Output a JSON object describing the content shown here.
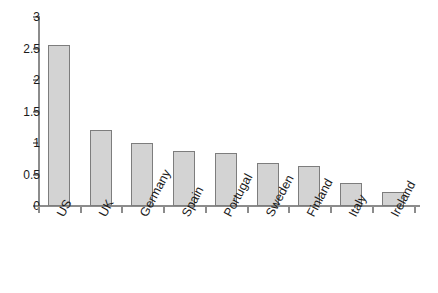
{
  "chart_data": {
    "type": "bar",
    "title": "",
    "subtitle": "",
    "xlabel": "",
    "ylabel": "",
    "categories": [
      "US",
      "UK",
      "Germany",
      "Spain",
      "Portugal",
      "Sweden",
      "Finland",
      "Italy",
      "Ireland"
    ],
    "values": [
      2.55,
      1.2,
      1.0,
      0.88,
      0.84,
      0.68,
      0.63,
      0.36,
      0.23
    ],
    "ylim": [
      0,
      3
    ],
    "ytick_labels": [
      "0",
      "0.5",
      "1",
      "1.5",
      "2",
      "2.5",
      "3"
    ],
    "ytick_values": [
      0,
      0.5,
      1,
      1.5,
      2,
      2.5,
      3
    ],
    "grid": false,
    "legend": null,
    "annotations": [],
    "colors": {
      "bar_fill": "#d3d3d3",
      "bar_border": "#7d7d7d",
      "axis": "#8c8c8c",
      "text": "#1a1a1a",
      "background": "#ffffff"
    }
  }
}
